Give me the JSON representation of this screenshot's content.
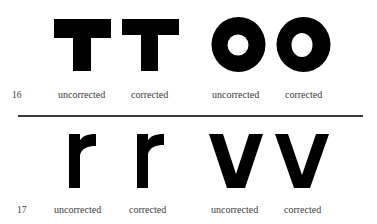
{
  "figures": [
    {
      "number": "16",
      "items": [
        {
          "glyph": "T",
          "label": "uncorrected"
        },
        {
          "glyph": "T",
          "label": "corrected"
        },
        {
          "glyph": "O",
          "label": "uncorrected"
        },
        {
          "glyph": "O",
          "label": "corrected"
        }
      ]
    },
    {
      "number": "17",
      "items": [
        {
          "glyph": "r",
          "label": "uncorrected"
        },
        {
          "glyph": "r",
          "label": "corrected"
        },
        {
          "glyph": "v",
          "label": "uncorrected"
        },
        {
          "glyph": "v",
          "label": "corrected"
        }
      ]
    }
  ],
  "colors": {
    "glyph": "#000000",
    "text": "#3a3a3a",
    "rule": "#3c3c3c"
  }
}
